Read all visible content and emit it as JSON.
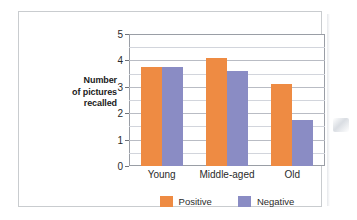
{
  "chart_data": {
    "type": "bar",
    "title": "",
    "xlabel": "",
    "ylabel": "Number of pictures recalled",
    "ylabel_lines": [
      "Number",
      "of pictures",
      "recalled"
    ],
    "categories": [
      "Young",
      "Middle-aged",
      "Old"
    ],
    "series": [
      {
        "name": "Positive",
        "color": "#ee8b43",
        "values": [
          3.75,
          4.1,
          3.1
        ]
      },
      {
        "name": "Negative",
        "color": "#8a8cc4",
        "values": [
          3.75,
          3.6,
          1.75
        ]
      }
    ],
    "ylim": [
      0,
      5
    ],
    "yticks": [
      0,
      1,
      2,
      3,
      4,
      5
    ],
    "ytick_labels": [
      "0",
      "1",
      "2",
      "3",
      "4",
      "5"
    ],
    "minor_gridlines": [
      0.5,
      1.5,
      2.5,
      3.5,
      4.5
    ],
    "grid": true,
    "legend_position": "bottom"
  },
  "colors": {
    "positive": "#ee8b43",
    "negative": "#8a8cc4",
    "frame_border": "#c9cccf",
    "plot_border": "#9a9ea6",
    "gridline_major": "#b9bcc4",
    "gridline_minor": "#d2d5dc",
    "text": "#2b2b2b"
  }
}
